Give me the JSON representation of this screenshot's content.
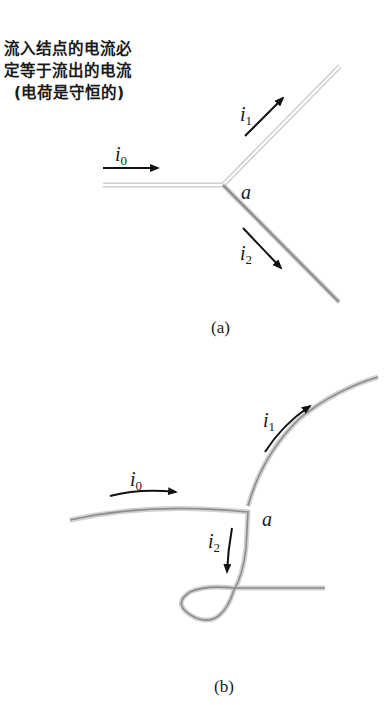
{
  "caption": {
    "line1": "流入结点的电流必",
    "line2": "定等于流出的电流",
    "line3": "(电荷是守恒的)"
  },
  "panel_a": {
    "label": "(a)",
    "node_label": "a",
    "currents": [
      {
        "symbol": "i",
        "subscript": "0"
      },
      {
        "symbol": "i",
        "subscript": "1"
      },
      {
        "symbol": "i",
        "subscript": "2"
      }
    ]
  },
  "panel_b": {
    "label": "(b)",
    "node_label": "a",
    "currents": [
      {
        "symbol": "i",
        "subscript": "0"
      },
      {
        "symbol": "i",
        "subscript": "1"
      },
      {
        "symbol": "i",
        "subscript": "2"
      }
    ]
  },
  "colors": {
    "wire_outer": "#c8c8c8",
    "wire_inner": "#8a8a8a",
    "arrow": "#111111",
    "text": "#1a1a1a"
  }
}
